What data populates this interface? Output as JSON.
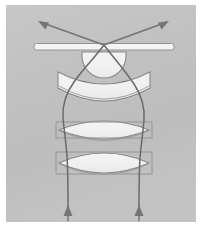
{
  "figure": {
    "name": "optical-ray-diagram",
    "title": "Microscope objective lens cross-section ray diagram",
    "kind": "schematic-line-drawing",
    "canvas": {
      "width": 204,
      "height": 231
    }
  },
  "colors": {
    "page_background": "#ffffff",
    "panel_background": "#c9c9c9",
    "panel_background_light": "#d2d2d2",
    "glass_fill": "#fdfdfd",
    "glass_fill_shade": "#f0f0f0",
    "element_outline": "#8e8e8e",
    "ray_stroke": "#6f6f6f",
    "arrow_stroke": "#7a7a7a",
    "slit_fill": "#ffffff",
    "slit_outline": "#9a9a9a"
  },
  "panel": {
    "x": 6,
    "y": 5,
    "width": 190,
    "height": 217
  },
  "elements": [
    {
      "id": "specimen-plate",
      "label": "specimen slide / cover plate",
      "type": "thin-horizontal-bar",
      "x": 34,
      "y": 43,
      "width": 140,
      "height": 7
    },
    {
      "id": "front-hemisphere",
      "label": "front hemispherical lens element",
      "type": "hemisphere-flat-up",
      "cx": 104,
      "top_y": 52,
      "half_width": 22,
      "bottom_y": 76
    },
    {
      "id": "meniscus-lens",
      "label": "meniscus lens element",
      "type": "meniscus-concave-up",
      "cx": 104,
      "top_y": 72,
      "half_width": 46,
      "bottom_y": 104
    },
    {
      "id": "biconvex-lens-upper",
      "label": "upper biconvex doublet element",
      "type": "biconvex",
      "cx": 104,
      "top_y": 118,
      "half_width": 45,
      "bottom_y": 143
    },
    {
      "id": "biconvex-lens-lower",
      "label": "lower biconvex doublet element",
      "type": "biconvex",
      "cx": 104,
      "top_y": 148,
      "half_width": 45,
      "bottom_y": 178
    }
  ],
  "rays": {
    "convergence_point": {
      "x": 104,
      "y": 45
    },
    "exit_left_x": 68,
    "exit_right_x": 139,
    "exit_y": 215,
    "upper_arrows": [
      {
        "id": "upper-ray-left",
        "tip_x": 38,
        "tip_y": 21
      },
      {
        "id": "upper-ray-right",
        "tip_x": 169,
        "tip_y": 21
      }
    ],
    "lower_arrows": [
      {
        "id": "lower-ray-left",
        "tip_x": 68,
        "tip_y": 207
      },
      {
        "id": "lower-ray-right",
        "tip_x": 139,
        "tip_y": 207
      }
    ]
  },
  "labels": {
    "none_visible": ""
  }
}
